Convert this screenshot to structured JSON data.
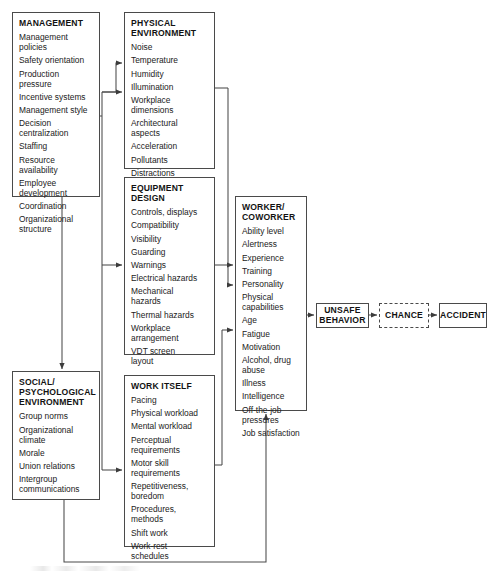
{
  "diagram": {
    "line_color": "#4a4a4a",
    "background": "#ffffff"
  },
  "nodes": {
    "management": {
      "title": "MANAGEMENT",
      "items": [
        "Management\npolicies",
        "Safety orientation",
        "Production pressure",
        "Incentive systems",
        "Management style",
        "Decision\ncentralization",
        "Staffing",
        "Resource\navailability",
        "Employee\ndevelopment",
        "Coordination",
        "Organizational\nstructure"
      ]
    },
    "physical_environment": {
      "title": "PHYSICAL\nENVIRONMENT",
      "items": [
        "Noise",
        "Temperature",
        "Humidity",
        "Illumination",
        "Workplace\ndimensions",
        "Architectural\naspects",
        "Acceleration",
        "Pollutants",
        "Distractions"
      ]
    },
    "equipment_design": {
      "title": "EQUIPMENT\nDESIGN",
      "items": [
        "Controls, displays",
        "Compatibility",
        "Visibility",
        "Guarding",
        "Warnings",
        "Electrical hazards",
        "Mechanical\nhazards",
        "Thermal hazards",
        "Workplace\narrangement",
        "VDT screen\nlayout"
      ]
    },
    "social_psychological_environment": {
      "title": "SOCIAL/\nPSYCHOLOGICAL\nENVIRONMENT",
      "items": [
        "Group norms",
        "Organizational\nclimate",
        "Morale",
        "Union relations",
        "Intergroup\ncommunications"
      ]
    },
    "work_itself": {
      "title": "WORK ITSELF",
      "items": [
        "Pacing",
        "Physical workload",
        "Mental workload",
        "Perceptual\nrequirements",
        "Motor skill\nrequirements",
        "Repetitiveness,\nboredom",
        "Procedures,\nmethods",
        "Shift work",
        "Work-rest\nschedules"
      ]
    },
    "worker_coworker": {
      "title": "WORKER/\nCOWORKER",
      "items": [
        "Ability level",
        "Alertness",
        "Experience",
        "Training",
        "Personality",
        "Physical\ncapabilities",
        "Age",
        "Fatigue",
        "Motivation",
        "Alcohol, drug\nabuse",
        "Illness",
        "Intelligence",
        "Off-the-job\npressures",
        "Job satisfaction"
      ]
    }
  },
  "terminals": {
    "unsafe_behavior": {
      "label": "UNSAFE\nBEHAVIOR",
      "style": "solid"
    },
    "chance": {
      "label": "CHANCE",
      "style": "dashed"
    },
    "accident": {
      "label": "ACCIDENT",
      "style": "solid"
    }
  },
  "flows": [
    {
      "from": "management",
      "to": "physical_environment"
    },
    {
      "from": "management",
      "to": "equipment_design"
    },
    {
      "from": "management",
      "to": "work_itself"
    },
    {
      "from": "management",
      "to": "social_psychological_environment"
    },
    {
      "from": "physical_environment",
      "to": "worker_coworker"
    },
    {
      "from": "equipment_design",
      "to": "worker_coworker"
    },
    {
      "from": "work_itself",
      "to": "worker_coworker"
    },
    {
      "from": "social_psychological_environment",
      "to": "worker_coworker"
    },
    {
      "from": "worker_coworker",
      "to": "unsafe_behavior"
    },
    {
      "from": "unsafe_behavior",
      "to": "chance"
    },
    {
      "from": "chance",
      "to": "accident"
    }
  ]
}
